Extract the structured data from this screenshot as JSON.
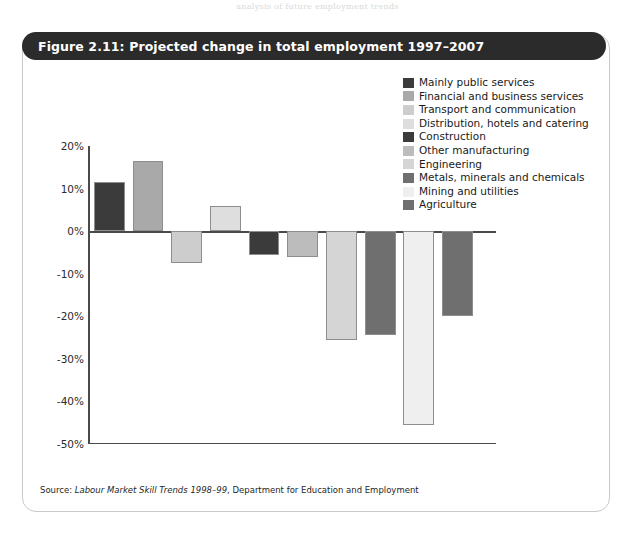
{
  "page_bleed_text": "analysis of future employment trends",
  "figure": {
    "title": "Figure 2.11: Projected change in total employment 1997–2007",
    "source_prefix": "Source: ",
    "source_italic": "Labour Market Skill Trends 1998–99",
    "source_suffix": ", Department for Education and Employment"
  },
  "colors": {
    "title_bar": "#2b2b2b",
    "frame_border": "#c9c9c9",
    "axis": "#4a4a4a",
    "bar_outline": "#8e8e8e",
    "text": "#1a1a1a"
  },
  "chart_data": {
    "type": "bar",
    "title": "Figure 2.11: Projected change in total employment 1997–2007",
    "xlabel": "",
    "ylabel": "",
    "ylim": [
      -50,
      20
    ],
    "ytick_labels": [
      "20%",
      "10%",
      "0%",
      "-10%",
      "-20%",
      "-30%",
      "-40%",
      "-50%"
    ],
    "ytick_values": [
      20,
      10,
      0,
      -10,
      -20,
      -30,
      -40,
      -50
    ],
    "grid": false,
    "legend_position": "top-right",
    "value_unit": "%",
    "categories": [
      "Mainly public services",
      "Financial and business services",
      "Transport and communication",
      "Distribution, hotels and catering",
      "Construction",
      "Other manufacturing",
      "Engineering",
      "Metals, minerals and chemicals",
      "Mining and utilities",
      "Agriculture"
    ],
    "values": [
      11.5,
      16.5,
      -7.5,
      6,
      -5.5,
      -6,
      -25.5,
      -24.5,
      -45.5,
      -20
    ],
    "bar_colors": [
      "#3b3b3b",
      "#a9a9a9",
      "#cdcdcd",
      "#dedede",
      "#3b3b3b",
      "#bcbcbc",
      "#d5d5d5",
      "#6f6f6f",
      "#efefef",
      "#6f6f6f"
    ]
  },
  "legend": {
    "items": [
      {
        "label": "Mainly public services",
        "color": "#3b3b3b"
      },
      {
        "label": "Financial and business services",
        "color": "#a9a9a9"
      },
      {
        "label": "Transport and communication",
        "color": "#cdcdcd"
      },
      {
        "label": "Distribution, hotels and catering",
        "color": "#dedede"
      },
      {
        "label": "Construction",
        "color": "#3b3b3b"
      },
      {
        "label": "Other manufacturing",
        "color": "#bcbcbc"
      },
      {
        "label": "Engineering",
        "color": "#d5d5d5"
      },
      {
        "label": "Metals, minerals and chemicals",
        "color": "#6f6f6f"
      },
      {
        "label": "Mining and utilities",
        "color": "#efefef"
      },
      {
        "label": "Agriculture",
        "color": "#6f6f6f"
      }
    ]
  }
}
